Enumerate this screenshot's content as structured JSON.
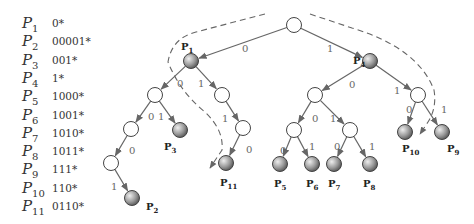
{
  "prefix_table": [
    {
      "name": "P",
      "sub": "1",
      "prefix": "0*"
    },
    {
      "name": "P",
      "sub": "2",
      "prefix": "00001*"
    },
    {
      "name": "P",
      "sub": "3",
      "prefix": "001*"
    },
    {
      "name": "P",
      "sub": "4",
      "prefix": "1*"
    },
    {
      "name": "P",
      "sub": "5",
      "prefix": "1000*"
    },
    {
      "name": "P",
      "sub": "6",
      "prefix": "1001*"
    },
    {
      "name": "P",
      "sub": "7",
      "prefix": "1010*"
    },
    {
      "name": "P",
      "sub": "8",
      "prefix": "1011*"
    },
    {
      "name": "P",
      "sub": "9",
      "prefix": "111*"
    },
    {
      "name": "P",
      "sub": "10",
      "prefix": "110*"
    },
    {
      "name": "P",
      "sub": "11",
      "prefix": "0110*"
    }
  ],
  "trie": {
    "nodes": [
      {
        "id": "root",
        "x": 294,
        "y": 25,
        "type": "internal"
      },
      {
        "id": "n0",
        "x": 191,
        "y": 61,
        "type": "prefix",
        "label": "P",
        "sub": "1",
        "lx": 181,
        "ly": 50
      },
      {
        "id": "n1",
        "x": 370,
        "y": 61,
        "type": "prefix",
        "label": "P",
        "sub": "4",
        "lx": 353,
        "ly": 64
      },
      {
        "id": "n00",
        "x": 155,
        "y": 95,
        "type": "internal"
      },
      {
        "id": "n01",
        "x": 222,
        "y": 95,
        "type": "internal"
      },
      {
        "id": "n000",
        "x": 131,
        "y": 129,
        "type": "internal"
      },
      {
        "id": "n001",
        "x": 180,
        "y": 130,
        "type": "prefix",
        "label": "P",
        "sub": "3",
        "lx": 164,
        "ly": 150
      },
      {
        "id": "n0000",
        "x": 111,
        "y": 163,
        "type": "internal"
      },
      {
        "id": "n00001",
        "x": 132,
        "y": 198,
        "type": "prefix",
        "label": "P",
        "sub": "2",
        "lx": 146,
        "ly": 210
      },
      {
        "id": "n011",
        "x": 243,
        "y": 128,
        "type": "internal"
      },
      {
        "id": "n0110",
        "x": 226,
        "y": 163,
        "type": "prefix",
        "label": "P",
        "sub": "11",
        "lx": 220,
        "ly": 186
      },
      {
        "id": "n10",
        "x": 315,
        "y": 95,
        "type": "internal"
      },
      {
        "id": "n11",
        "x": 418,
        "y": 95,
        "type": "internal"
      },
      {
        "id": "n100",
        "x": 294,
        "y": 130,
        "type": "internal"
      },
      {
        "id": "n101",
        "x": 350,
        "y": 130,
        "type": "internal"
      },
      {
        "id": "n1000",
        "x": 280,
        "y": 164,
        "type": "prefix",
        "label": "P",
        "sub": "5",
        "lx": 274,
        "ly": 187
      },
      {
        "id": "n1001",
        "x": 312,
        "y": 164,
        "type": "prefix",
        "label": "P",
        "sub": "6",
        "lx": 306,
        "ly": 187
      },
      {
        "id": "n1010",
        "x": 334,
        "y": 164,
        "type": "prefix",
        "label": "P",
        "sub": "7",
        "lx": 328,
        "ly": 187
      },
      {
        "id": "n1011",
        "x": 370,
        "y": 164,
        "type": "prefix",
        "label": "P",
        "sub": "8",
        "lx": 363,
        "ly": 187
      },
      {
        "id": "n110",
        "x": 405,
        "y": 132,
        "type": "prefix",
        "label": "P",
        "sub": "10",
        "lx": 402,
        "ly": 152
      },
      {
        "id": "n111",
        "x": 442,
        "y": 132,
        "type": "prefix",
        "label": "P",
        "sub": "9",
        "lx": 447,
        "ly": 152
      }
    ],
    "edges": [
      {
        "from": "root",
        "to": "n0",
        "bit": "0",
        "lx": 242,
        "ly": 52
      },
      {
        "from": "root",
        "to": "n1",
        "bit": "1",
        "lx": 327,
        "ly": 52
      },
      {
        "from": "n0",
        "to": "n00",
        "bit": "0",
        "lx": 177,
        "ly": 87
      },
      {
        "from": "n0",
        "to": "n01",
        "bit": "1",
        "lx": 198,
        "ly": 87
      },
      {
        "from": "n00",
        "to": "n000",
        "bit": "0",
        "lx": 148,
        "ly": 120
      },
      {
        "from": "n00",
        "to": "n001",
        "bit": "1",
        "lx": 158,
        "ly": 120
      },
      {
        "from": "n000",
        "to": "n0000",
        "bit": "0",
        "lx": 129,
        "ly": 154
      },
      {
        "from": "n0000",
        "to": "n00001",
        "bit": "1",
        "lx": 111,
        "ly": 190
      },
      {
        "from": "n01",
        "to": "n011",
        "bit": "1",
        "lx": 222,
        "ly": 122
      },
      {
        "from": "n011",
        "to": "n0110",
        "bit": "0",
        "lx": 246,
        "ly": 153
      },
      {
        "from": "n1",
        "to": "n10",
        "bit": "0",
        "lx": 349,
        "ly": 88
      },
      {
        "from": "n1",
        "to": "n11",
        "bit": "1",
        "lx": 394,
        "ly": 94
      },
      {
        "from": "n10",
        "to": "n100",
        "bit": "0",
        "lx": 312,
        "ly": 122
      },
      {
        "from": "n10",
        "to": "n101",
        "bit": "1",
        "lx": 330,
        "ly": 122
      },
      {
        "from": "n100",
        "to": "n1000",
        "bit": "0",
        "lx": 280,
        "ly": 154
      },
      {
        "from": "n100",
        "to": "n1001",
        "bit": "1",
        "lx": 309,
        "ly": 150
      },
      {
        "from": "n101",
        "to": "n1010",
        "bit": "0",
        "lx": 334,
        "ly": 150
      },
      {
        "from": "n101",
        "to": "n1011",
        "bit": "1",
        "lx": 369,
        "ly": 150
      },
      {
        "from": "n11",
        "to": "n110",
        "bit": "0",
        "lx": 406,
        "ly": 113
      },
      {
        "from": "n11",
        "to": "n111",
        "bit": "1",
        "lx": 441,
        "ly": 113
      }
    ],
    "dashed_paths": [
      {
        "id": "traversal-left",
        "d": "M 265 14 L 196 32 Q 172 38 168 62 Q 180 92 205 112 Q 224 130 222 150 L 210 168"
      },
      {
        "id": "traversal-right",
        "d": "M 310 14 L 352 28 Q 418 48 434 90 Q 437 108 428 122 L 420 134"
      }
    ]
  },
  "colors": {
    "edge": "#666666",
    "dash": "#666666",
    "internal_fill": "#ffffff",
    "prefix_fill_light": "#e6e6e6",
    "prefix_fill_dark": "#555555",
    "text": "#333333"
  }
}
